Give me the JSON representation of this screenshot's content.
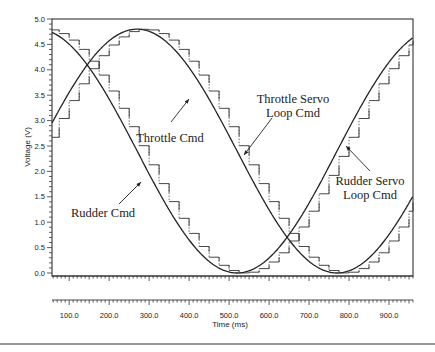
{
  "chart_data": {
    "type": "line",
    "title": "",
    "xlabel": "Time (ms)",
    "ylabel": "Voltage (V)",
    "xlim": [
      57,
      960
    ],
    "ylim": [
      0.0,
      5.0
    ],
    "grid": false,
    "legend": "none (inline annotations)",
    "x_ticks": [
      "100.0",
      "200.0",
      "300.0",
      "400.0",
      "500.0",
      "600.0",
      "700.0",
      "800.0",
      "900.0"
    ],
    "y_ticks": [
      "0.0",
      "0.5",
      "1.0",
      "1.5",
      "2.0",
      "2.5",
      "3.0",
      "3.5",
      "4.0",
      "4.5",
      "5.0"
    ],
    "series": [
      {
        "name": "Throttle Cmd",
        "style": "solid smooth sine",
        "amplitude": 2.4,
        "offset": 2.4,
        "period_ms": 1000,
        "peak_ms": 270,
        "peak_v": 4.8,
        "trough_ms": 770,
        "trough_v": 0.0
      },
      {
        "name": "Throttle Servo Loop Cmd",
        "style": "staircase (solid + dotted sample lines), lags Throttle Cmd",
        "step_ms": 25
      },
      {
        "name": "Rudder Cmd",
        "style": "solid smooth sine",
        "amplitude": 2.4,
        "offset": 2.4,
        "period_ms": 1000,
        "peak_ms": 20,
        "peak_v": 4.8,
        "trough_ms": 520,
        "trough_v": 0.0
      },
      {
        "name": "Rudder Servo Loop Cmd",
        "style": "staircase (solid + dotted sample lines), lags Rudder Cmd",
        "step_ms": 25
      }
    ],
    "annotations": [
      {
        "text": "Throttle Cmd",
        "x_ms": 310,
        "y_v": 3.7
      },
      {
        "text": [
          "Throttle Servo",
          "Loop Cmd"
        ],
        "x_ms": 590,
        "y_v": 3.5
      },
      {
        "text": "Rudder Cmd",
        "x_ms": 120,
        "y_v": 1.2
      },
      {
        "text": [
          "Rudder Servo",
          "Loop Cmd"
        ],
        "x_ms": 880,
        "y_v": 2.2
      }
    ]
  }
}
